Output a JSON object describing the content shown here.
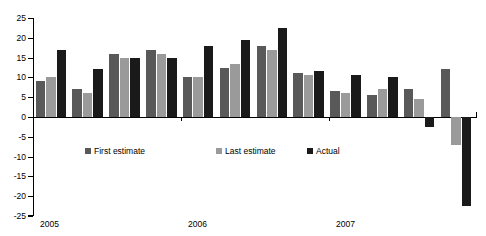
{
  "chart_data": {
    "type": "bar",
    "title": "",
    "xlabel": "",
    "ylabel": "",
    "ylim": [
      -25,
      25
    ],
    "grid": false,
    "legend_position": "inside-bottom",
    "categories": [
      "2005 Q1",
      "2005 Q2",
      "2005 Q3",
      "2005 Q4",
      "2006 Q1",
      "2006 Q2",
      "2006 Q3",
      "2006 Q4",
      "2007 Q1",
      "2007 Q2",
      "2007 Q3",
      "2007 Q4"
    ],
    "group_labels": [
      "2005",
      "2006",
      "2007"
    ],
    "ticks": [
      25,
      20,
      15,
      10,
      5,
      0,
      -5,
      -10,
      -15,
      -20,
      -25
    ],
    "tick_labels": [
      "25",
      "20",
      "15",
      "10",
      "5",
      "0",
      "-5",
      "-10",
      "-15",
      "-20",
      "-25"
    ],
    "series": [
      {
        "name": "First estimate",
        "color": "#595959",
        "values": [
          9,
          7,
          16,
          17,
          10,
          12.5,
          18,
          11,
          6.5,
          5.5,
          7,
          12
        ]
      },
      {
        "name": "Last estimate",
        "color": "#9a9a9a",
        "values": [
          10,
          6,
          15,
          16,
          10,
          13.5,
          17,
          10.5,
          6,
          7,
          4.5,
          -7
        ]
      },
      {
        "name": "Actual",
        "color": "#1a1a1a",
        "values": [
          17,
          12,
          15,
          15,
          18,
          19.5,
          22.5,
          11.5,
          10.5,
          10,
          -2.5,
          -22.5
        ]
      }
    ]
  },
  "legend": {
    "first_label": "First estimate",
    "last_label": "Last estimate",
    "actual_label": "Actual"
  },
  "axis": {
    "year_2005": "2005",
    "year_2006": "2006",
    "year_2007": "2007"
  }
}
